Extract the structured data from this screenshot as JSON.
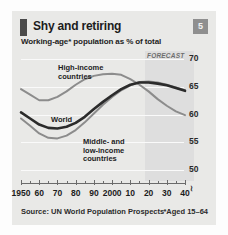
{
  "card": {
    "badge": "5",
    "title": "Shy and retiring",
    "subtitle": "Working-age* population as % of total",
    "source": "Source: UN World Population Prospects",
    "footnote": "*Aged 15–64"
  },
  "chart_data": {
    "type": "line",
    "title": "Shy and retiring",
    "subtitle": "Working-age* population as % of total",
    "xlabel": "",
    "ylabel": "% of total",
    "xlim": [
      1950,
      2040
    ],
    "ylim": [
      48,
      71.5
    ],
    "yticks": [
      50,
      55,
      60,
      65,
      70
    ],
    "ytick_labels": [
      "50",
      "55",
      "60",
      "65",
      "70"
    ],
    "axis_break_below": "50",
    "grid": true,
    "legend": "inline-labels",
    "xticks": [
      1950,
      1960,
      1970,
      1980,
      1990,
      2000,
      2010,
      2020,
      2030,
      2040
    ],
    "xtick_labels": [
      "1950",
      "60",
      "70",
      "80",
      "90",
      "2000",
      "10",
      "20",
      "30",
      "40"
    ],
    "minor_tick_interval": 5,
    "annotations": [
      {
        "text": "FORECAST",
        "x_start": 2015,
        "x_end": 2040,
        "style": "shaded-band"
      }
    ],
    "x": [
      1950,
      1955,
      1960,
      1965,
      1970,
      1975,
      1980,
      1985,
      1990,
      1995,
      2000,
      2005,
      2010,
      2015,
      2020,
      2025,
      2030,
      2035,
      2040
    ],
    "series": [
      {
        "name": "High-income countries",
        "color": "#8c8c8c",
        "values": [
          64.6,
          63.6,
          62.6,
          62.6,
          63.2,
          64.2,
          65.4,
          66.4,
          67.0,
          67.3,
          67.4,
          67.2,
          66.4,
          65.4,
          64.2,
          62.8,
          61.6,
          60.6,
          59.9
        ]
      },
      {
        "name": "World",
        "color": "#2b2b2b",
        "values": [
          60.4,
          59.3,
          58.2,
          57.6,
          57.5,
          57.8,
          58.5,
          59.6,
          61.0,
          62.3,
          63.5,
          64.6,
          65.4,
          65.8,
          65.8,
          65.6,
          65.3,
          64.8,
          64.3
        ]
      },
      {
        "name": "Middle- and low-income countries",
        "color": "#8c8c8c",
        "values": [
          59.3,
          58.0,
          56.6,
          55.8,
          55.7,
          56.2,
          57.2,
          58.6,
          60.2,
          61.8,
          63.2,
          64.4,
          65.3,
          65.9,
          66.0,
          65.8,
          65.4,
          64.9,
          64.4
        ]
      }
    ],
    "series_label_positions": [
      {
        "name": "High-income countries",
        "label": "High-income\ncountries"
      },
      {
        "name": "World",
        "label": "World"
      },
      {
        "name": "Middle- and low-income countries",
        "label": "Middle- and\nlow-income\ncountries"
      }
    ]
  },
  "labels": {
    "high": "High-income\ncountries",
    "world": "World",
    "mid": "Middle- and\nlow-income\ncountries",
    "forecast": "FORECAST",
    "axis_break": "≀"
  }
}
